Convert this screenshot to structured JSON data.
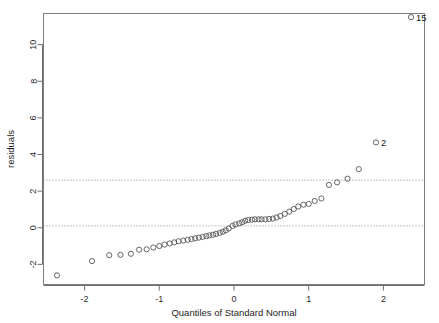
{
  "chart_data": {
    "type": "scatter",
    "title": "",
    "subtitle": "",
    "xlabel": "Quantiles of Standard Normal",
    "ylabel": "residuals",
    "xlim": [
      -2.55,
      2.55
    ],
    "ylim": [
      -3.1,
      11.7
    ],
    "xticks": [
      -2,
      -1,
      0,
      1,
      2
    ],
    "xticklabels": [
      "-2",
      "-1",
      "0",
      "1",
      "2"
    ],
    "yticks": [
      -2,
      0,
      2,
      4,
      6,
      8,
      10
    ],
    "yticklabels": [
      "-2",
      "0",
      "2",
      "4",
      "6",
      "8",
      "10"
    ],
    "grid": false,
    "legend": null,
    "reference_lines": [
      {
        "orientation": "horizontal",
        "value": 2.6,
        "style": "dotted"
      },
      {
        "orientation": "horizontal",
        "value": 0.1,
        "style": "dotted"
      }
    ],
    "series": [
      {
        "name": "residuals",
        "marker": "open-circle",
        "x": [
          -2.37,
          -1.9,
          -1.67,
          -1.52,
          -1.38,
          -1.27,
          -1.17,
          -1.08,
          -1.0,
          -0.93,
          -0.86,
          -0.8,
          -0.74,
          -0.68,
          -0.62,
          -0.57,
          -0.52,
          -0.47,
          -0.42,
          -0.37,
          -0.33,
          -0.28,
          -0.24,
          -0.19,
          -0.15,
          -0.11,
          -0.07,
          -0.02,
          0.02,
          0.07,
          0.11,
          0.15,
          0.19,
          0.24,
          0.28,
          0.33,
          0.37,
          0.42,
          0.47,
          0.52,
          0.57,
          0.62,
          0.68,
          0.74,
          0.8,
          0.86,
          0.93,
          1.0,
          1.08,
          1.17,
          1.27,
          1.38,
          1.52,
          1.67,
          1.9,
          2.37
        ],
        "y": [
          -2.6,
          -1.82,
          -1.5,
          -1.48,
          -1.42,
          -1.2,
          -1.18,
          -1.08,
          -1.0,
          -0.92,
          -0.86,
          -0.8,
          -0.74,
          -0.7,
          -0.66,
          -0.62,
          -0.58,
          -0.54,
          -0.5,
          -0.46,
          -0.42,
          -0.38,
          -0.34,
          -0.28,
          -0.22,
          -0.14,
          -0.04,
          0.1,
          0.18,
          0.24,
          0.3,
          0.38,
          0.42,
          0.44,
          0.46,
          0.46,
          0.46,
          0.46,
          0.48,
          0.5,
          0.56,
          0.64,
          0.76,
          0.88,
          1.02,
          1.16,
          1.26,
          1.3,
          1.46,
          1.6,
          2.34,
          2.48,
          2.68,
          3.2,
          4.66,
          11.5
        ]
      }
    ],
    "point_labels": [
      {
        "text": "15",
        "x": 2.37,
        "y": 11.5,
        "anchor": "right"
      },
      {
        "text": "2",
        "x": 1.9,
        "y": 4.66,
        "anchor": "right"
      }
    ]
  },
  "plot": {
    "background_color": "#ffffff",
    "marker_color": "#555555",
    "axis_color": "#6f6f6f",
    "text_color": "#1c1c1c"
  }
}
